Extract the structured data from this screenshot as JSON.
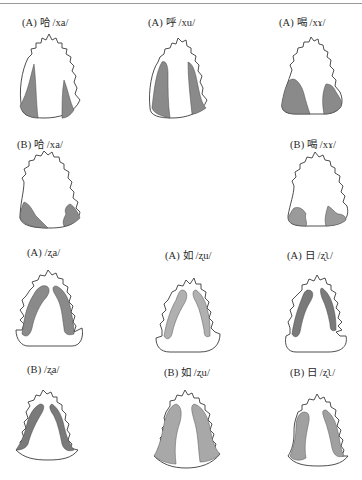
{
  "figure": {
    "type": "palatogram-grid",
    "rows": 4,
    "cols": 3
  },
  "panels": [
    {
      "id": "r1c1",
      "label": "(A) 哈 /xa/",
      "speaker": "A",
      "char": "哈",
      "ipa": "/xa/",
      "pattern": "velar-side-contact"
    },
    {
      "id": "r1c2",
      "label": "(A) 呼 /xu/",
      "speaker": "A",
      "char": "呼",
      "ipa": "/xu/",
      "pattern": "velar-side-contact"
    },
    {
      "id": "r1c3",
      "label": "(A) 喝 /xɤ/",
      "speaker": "A",
      "char": "喝",
      "ipa": "/xɤ/",
      "pattern": "posterior-contact"
    },
    {
      "id": "r2c1",
      "label": "(B) 哈 /xa/",
      "speaker": "B",
      "char": "哈",
      "ipa": "/xa/",
      "pattern": "posterior-contact"
    },
    {
      "id": "r2c3",
      "label": "(B) 喝 /xɤ/",
      "speaker": "B",
      "char": "喝",
      "ipa": "/xɤ/",
      "pattern": "posterior-contact"
    },
    {
      "id": "r3c1",
      "label": "(A) /ʐa/",
      "speaker": "A",
      "char": "",
      "ipa": "/ʐa/",
      "pattern": "retroflex-lateral"
    },
    {
      "id": "r3c2",
      "label": "(A) 如 /ʐu/",
      "speaker": "A",
      "char": "如",
      "ipa": "/ʐu/",
      "pattern": "retroflex-lateral"
    },
    {
      "id": "r3c3",
      "label": "(A) 日 /ʐʅ/",
      "speaker": "A",
      "char": "日",
      "ipa": "/ʐʅ/",
      "pattern": "retroflex-lateral"
    },
    {
      "id": "r4c1",
      "label": "(B) /ʐa/",
      "speaker": "B",
      "char": "",
      "ipa": "/ʐa/",
      "pattern": "retroflex-lateral"
    },
    {
      "id": "r4c2",
      "label": "(B) 如 /ʐu/",
      "speaker": "B",
      "char": "如",
      "ipa": "/ʐu/",
      "pattern": "retroflex-lateral"
    },
    {
      "id": "r4c3",
      "label": "(B) 日 /ʐʅ/",
      "speaker": "B",
      "char": "日",
      "ipa": "/ʐʅ/",
      "pattern": "retroflex-lateral"
    }
  ],
  "colors": {
    "outline": "#3a3a3a",
    "contact_fill": "#8a8a8a",
    "rule": "#9a9a9a"
  }
}
